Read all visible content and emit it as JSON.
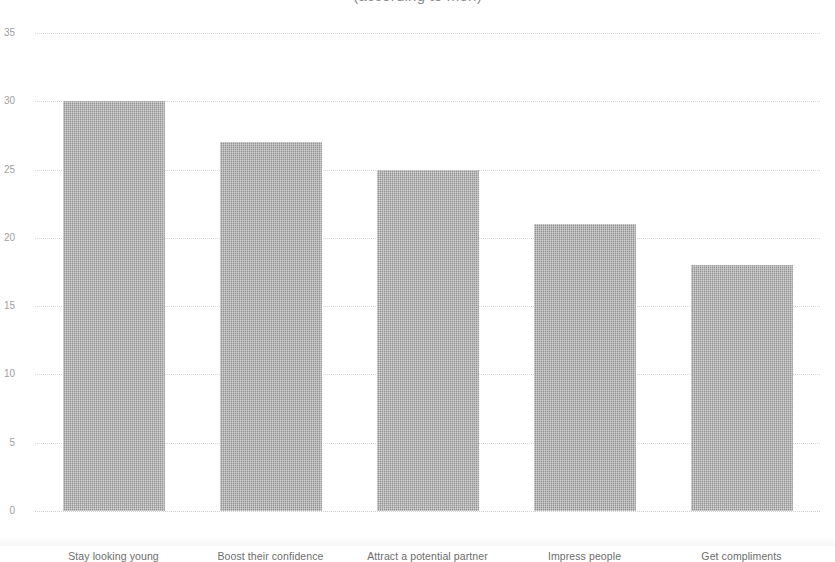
{
  "chart_data": {
    "type": "bar",
    "title": "(according to men)",
    "xlabel": "",
    "ylabel": "",
    "ylim": [
      0,
      35
    ],
    "ytick_values": [
      0,
      5,
      10,
      15,
      20,
      25,
      30,
      35
    ],
    "ytick_labels": [
      "0",
      "5",
      "10",
      "15",
      "20",
      "25",
      "30",
      "35"
    ],
    "grid": true,
    "grid_axis": "y",
    "legend": false,
    "legend_position": "none",
    "orientation": "vertical",
    "bar_color": "#9b9b9b",
    "categories": [
      "Stay looking young",
      "Boost their confidence",
      "Attract a potential partner",
      "Impress people",
      "Get compliments"
    ],
    "values": [
      30,
      27,
      25,
      21,
      18
    ],
    "annotations": []
  },
  "colors": {
    "bar_fill": "#9b9b9b",
    "gridline": "#d8d8d8",
    "tick_label": "#a0a0a0",
    "category_label": "#6d6d6d",
    "title": "#8c8c8c",
    "background": "#ffffff"
  }
}
